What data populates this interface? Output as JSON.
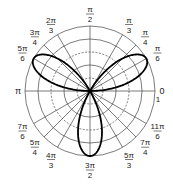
{
  "diagram": {
    "type": "polar-rose",
    "equation": "r = sin(3θ)",
    "center": [
      90,
      91
    ],
    "radius_px": 65,
    "rings": [
      0.2,
      0.4,
      0.6,
      0.8,
      1.0
    ],
    "ring_styles": [
      "dashed",
      "solid",
      "dashed",
      "solid",
      "solid"
    ],
    "radial_label": "1",
    "curve_color": "#000000",
    "grid_color": "#444444",
    "angle_labels": [
      {
        "id": "a0",
        "num": "0",
        "den": "",
        "deg": 0
      },
      {
        "id": "a30",
        "num": "π",
        "den": "6",
        "deg": 30
      },
      {
        "id": "a45",
        "num": "π",
        "den": "4",
        "deg": 45
      },
      {
        "id": "a60",
        "num": "π",
        "den": "3",
        "deg": 60
      },
      {
        "id": "a90",
        "num": "π",
        "den": "2",
        "deg": 90
      },
      {
        "id": "a120",
        "num": "2π",
        "den": "3",
        "deg": 120
      },
      {
        "id": "a135",
        "num": "3π",
        "den": "4",
        "deg": 135
      },
      {
        "id": "a150",
        "num": "5π",
        "den": "6",
        "deg": 150
      },
      {
        "id": "a180",
        "num": "π",
        "den": "",
        "deg": 180
      },
      {
        "id": "a210",
        "num": "7π",
        "den": "6",
        "deg": 210
      },
      {
        "id": "a225",
        "num": "5π",
        "den": "4",
        "deg": 225
      },
      {
        "id": "a240",
        "num": "4π",
        "den": "3",
        "deg": 240
      },
      {
        "id": "a270",
        "num": "3π",
        "den": "2",
        "deg": 270
      },
      {
        "id": "a300",
        "num": "5π",
        "den": "3",
        "deg": 300
      },
      {
        "id": "a315",
        "num": "7π",
        "den": "4",
        "deg": 315
      },
      {
        "id": "a330",
        "num": "11π",
        "den": "6",
        "deg": 330
      }
    ]
  }
}
